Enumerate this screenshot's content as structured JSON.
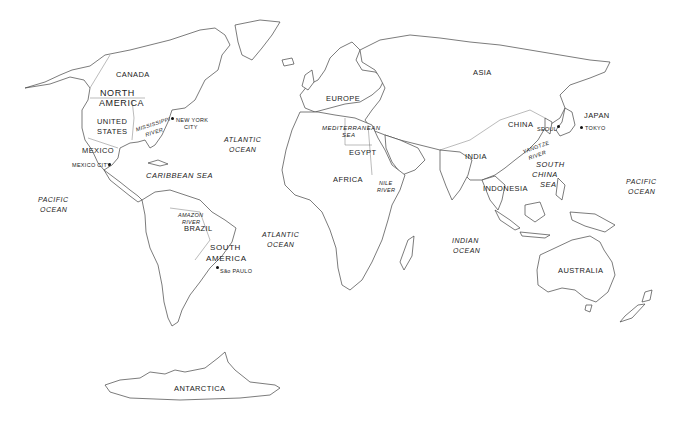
{
  "map": {
    "title": "World Map",
    "continents": [
      {
        "id": "north_america",
        "label": "NORTH\nAMERICA"
      },
      {
        "id": "south_america",
        "label": "SOUTH\nAMERICA"
      },
      {
        "id": "europe",
        "label": "EUROPE"
      },
      {
        "id": "asia",
        "label": "ASIA"
      },
      {
        "id": "africa",
        "label": "AFRICA"
      },
      {
        "id": "australia",
        "label": "AUSTRALIA"
      },
      {
        "id": "antarctica",
        "label": "ANTARCTICA"
      }
    ],
    "countries": {
      "canada": "CANADA",
      "united_states": "UNITED STATES",
      "mexico": "MEXICO",
      "brazil": "BRAZIL",
      "egypt": "EGYPT",
      "china": "CHINA",
      "india": "INDIA",
      "japan": "JAPAN",
      "indonesia": "INDONESIA"
    },
    "oceans": {
      "pacific_west": "PACIFIC OCEAN",
      "atlantic_north": "ATLANTIC OCEAN",
      "atlantic_south": "ATLANTIC OCEAN",
      "indian": "INDIAN OCEAN",
      "pacific_east": "PACIFIC OCEAN"
    },
    "seas": {
      "caribbean": "CARIBBEAN SEA",
      "mediterranean": "MEDITERRANEAN SEA",
      "south_china": "SOUTH CHINA SEA"
    },
    "rivers": {
      "mississippi": "MISSISSIPPI RIVER",
      "amazon": "AMAZON RIVER",
      "nile": "NILE RIVER",
      "yangtze": "YANGTZE RIVER"
    },
    "cities": {
      "new_york": "NEW YORK CITY",
      "mexico_city": "MEXICO CITY",
      "sao_paulo": "São PAULO",
      "seoul": "SEOUL",
      "tokyo": "TOKYO"
    }
  },
  "labels": {
    "canada": "CANADA",
    "north_america_1": "NORTH",
    "north_america_2": "AMERICA",
    "united_states_1": "UNITED",
    "united_states_2": "STATES",
    "mississippi_1": "MISSISSIPPI",
    "mississippi_2": "RIVER",
    "new_york_1": "NEW YORK",
    "new_york_2": "CITY",
    "mexico": "MEXICO",
    "mexico_city": "MEXICO CITY",
    "caribbean": "CARIBBEAN SEA",
    "pacific_w_1": "PACIFIC",
    "pacific_w_2": "OCEAN",
    "amazon_1": "AMAZON",
    "amazon_2": "RIVER",
    "brazil": "BRAZIL",
    "south_america_1": "SOUTH",
    "south_america_2": "AMERICA",
    "sao_paulo": "São PAULO",
    "atlantic_n_1": "ATLANTIC",
    "atlantic_n_2": "OCEAN",
    "atlantic_s_1": "ATLANTIC",
    "atlantic_s_2": "OCEAN",
    "europe": "EUROPE",
    "mediterranean_1": "MEDITERRANEAN",
    "mediterranean_2": "SEA",
    "egypt": "EGYPT",
    "africa": "AFRICA",
    "nile_1": "NILE",
    "nile_2": "RIVER",
    "asia": "ASIA",
    "china": "CHINA",
    "seoul": "SEOUL",
    "japan": "JAPAN",
    "tokyo": "TOKYO",
    "india": "INDIA",
    "yangtze_1": "YANGTZE",
    "yangtze_2": "RIVER",
    "south_china_1": "SOUTH",
    "south_china_2": "CHINA",
    "south_china_3": "SEA",
    "indonesia": "INDONESIA",
    "indian_1": "INDIAN",
    "indian_2": "OCEAN",
    "pacific_e_1": "PACIFIC",
    "pacific_e_2": "OCEAN",
    "australia": "AUSTRALIA",
    "antarctica": "ANTARCTICA"
  }
}
